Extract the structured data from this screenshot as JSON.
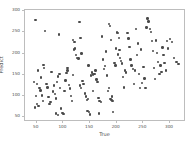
{
  "chart_data": {
    "type": "scatter",
    "title": "",
    "xlabel": "True",
    "ylabel": "Predict",
    "xlim": [
      28,
      330
    ],
    "ylim": [
      38,
      303
    ],
    "xticks": [
      50,
      100,
      150,
      200,
      250,
      300
    ],
    "yticks": [
      50,
      100,
      150,
      200,
      250,
      300
    ],
    "xticklabels": [
      "50",
      "100",
      "150",
      "200",
      "250",
      "300"
    ],
    "yticklabels": [
      "50",
      "100",
      "150",
      "200",
      "250",
      "300"
    ],
    "grid": false,
    "legend": null,
    "marker": "circle",
    "marker_color": "#4a4a4a",
    "marker_size": 2.4,
    "frame_color": "#bdbdbd",
    "background": "#ffffff",
    "series": [
      {
        "name": "predicted-vs-true",
        "points": [
          [
            48,
            279
          ],
          [
            52,
            160
          ],
          [
            50,
            128
          ],
          [
            49,
            100
          ],
          [
            51,
            81
          ],
          [
            53,
            76
          ],
          [
            47,
            72
          ],
          [
            55,
            118
          ],
          [
            57,
            113
          ],
          [
            45,
            133
          ],
          [
            58,
            143
          ],
          [
            60,
            101
          ],
          [
            62,
            88
          ],
          [
            64,
            166
          ],
          [
            66,
            254
          ],
          [
            68,
            128
          ],
          [
            70,
            120
          ],
          [
            72,
            97
          ],
          [
            74,
            80
          ],
          [
            76,
            85
          ],
          [
            63,
            173
          ],
          [
            78,
            157
          ],
          [
            80,
            110
          ],
          [
            82,
            124
          ],
          [
            84,
            104
          ],
          [
            86,
            94
          ],
          [
            88,
            132
          ],
          [
            90,
            146
          ],
          [
            92,
            245
          ],
          [
            94,
            118
          ],
          [
            96,
            70
          ],
          [
            98,
            60
          ],
          [
            100,
            57
          ],
          [
            102,
            112
          ],
          [
            104,
            136
          ],
          [
            106,
            154
          ],
          [
            108,
            160
          ],
          [
            93,
            151
          ],
          [
            110,
            126
          ],
          [
            112,
            117
          ],
          [
            114,
            99
          ],
          [
            116,
            88
          ],
          [
            118,
            149
          ],
          [
            120,
            210
          ],
          [
            122,
            212
          ],
          [
            124,
            196
          ],
          [
            126,
            190
          ],
          [
            128,
            188
          ],
          [
            130,
            274
          ],
          [
            132,
            237
          ],
          [
            134,
            200
          ],
          [
            136,
            135
          ],
          [
            138,
            128
          ],
          [
            140,
            105
          ],
          [
            142,
            98
          ],
          [
            144,
            90
          ],
          [
            146,
            92
          ],
          [
            148,
            62
          ],
          [
            150,
            56
          ],
          [
            131,
            124
          ],
          [
            133,
            118
          ],
          [
            152,
            148
          ],
          [
            154,
            155
          ],
          [
            156,
            150
          ],
          [
            158,
            152
          ],
          [
            160,
            160
          ],
          [
            162,
            139
          ],
          [
            164,
            133
          ],
          [
            166,
            95
          ],
          [
            168,
            88
          ],
          [
            170,
            86
          ],
          [
            172,
            240
          ],
          [
            174,
            186
          ],
          [
            176,
            164
          ],
          [
            178,
            170
          ],
          [
            180,
            205
          ],
          [
            182,
            148
          ],
          [
            184,
            112
          ],
          [
            186,
            118
          ],
          [
            188,
            92
          ],
          [
            190,
            90
          ],
          [
            192,
            88
          ],
          [
            185,
            270
          ],
          [
            187,
            265
          ],
          [
            189,
            232
          ],
          [
            191,
            98
          ],
          [
            193,
            62
          ],
          [
            196,
            178
          ],
          [
            198,
            172
          ],
          [
            200,
            250
          ],
          [
            202,
            249
          ],
          [
            204,
            237
          ],
          [
            206,
            190
          ],
          [
            208,
            182
          ],
          [
            210,
            176
          ],
          [
            212,
            145
          ],
          [
            214,
            120
          ],
          [
            216,
            160
          ],
          [
            218,
            155
          ],
          [
            203,
            198
          ],
          [
            205,
            208
          ],
          [
            220,
            249
          ],
          [
            222,
            236
          ],
          [
            224,
            215
          ],
          [
            226,
            186
          ],
          [
            228,
            172
          ],
          [
            230,
            163
          ],
          [
            232,
            128
          ],
          [
            234,
            160
          ],
          [
            236,
            258
          ],
          [
            238,
            196
          ],
          [
            240,
            224
          ],
          [
            242,
            152
          ],
          [
            244,
            118
          ],
          [
            246,
            210
          ],
          [
            248,
            130
          ],
          [
            250,
            168
          ],
          [
            252,
            141
          ],
          [
            254,
            119
          ],
          [
            256,
            262
          ],
          [
            258,
            283
          ],
          [
            260,
            276
          ],
          [
            262,
            258
          ],
          [
            264,
            251
          ],
          [
            266,
            230
          ],
          [
            268,
            206
          ],
          [
            270,
            166
          ],
          [
            272,
            140
          ],
          [
            274,
            231
          ],
          [
            276,
            202
          ],
          [
            278,
            180
          ],
          [
            280,
            152
          ],
          [
            282,
            172
          ],
          [
            284,
            156
          ],
          [
            286,
            214
          ],
          [
            288,
            196
          ],
          [
            290,
            178
          ],
          [
            292,
            160
          ],
          [
            294,
            230
          ],
          [
            296,
            212
          ],
          [
            300,
            234
          ],
          [
            304,
            228
          ],
          [
            308,
            190
          ],
          [
            312,
            180
          ],
          [
            316,
            175
          ],
          [
            118,
            232
          ],
          [
            121,
            228
          ],
          [
            86,
            58
          ],
          [
            90,
            54
          ],
          [
            108,
            166
          ],
          [
            145,
            64
          ],
          [
            167,
            58
          ],
          [
            199,
            212
          ],
          [
            147,
            172
          ],
          [
            155,
            112
          ]
        ]
      }
    ]
  }
}
